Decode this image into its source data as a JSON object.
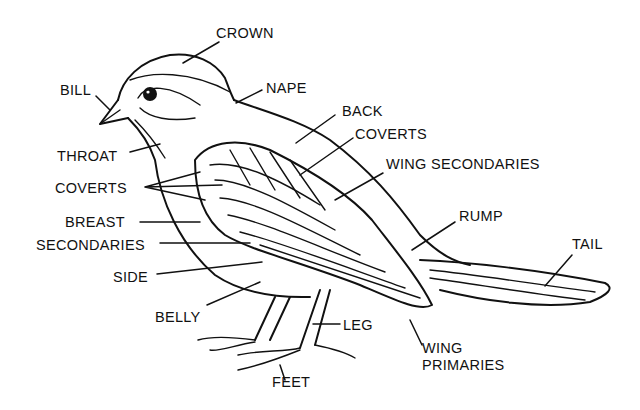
{
  "diagram": {
    "colors": {
      "ink": "#111111",
      "background": "#ffffff"
    },
    "labels": {
      "crown": "CROWN",
      "bill": "BILL",
      "nape": "NAPE",
      "back": "BACK",
      "coverts_upper": "COVERTS",
      "wing_secondaries": "WING SECONDARIES",
      "throat": "THROAT",
      "coverts_left": "COVERTS",
      "breast": "BREAST",
      "rump": "RUMP",
      "secondaries": "SECONDARIES",
      "tail": "TAIL",
      "side": "SIDE",
      "belly": "BELLY",
      "leg": "LEG",
      "wing_primaries_line1": "WING",
      "wing_primaries_line2": "PRIMARIES",
      "feet": "FEET"
    }
  }
}
